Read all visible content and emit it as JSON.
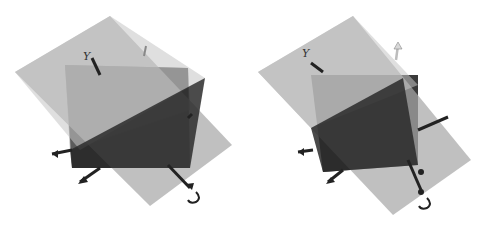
{
  "figure": {
    "colors": {
      "background": "#ffffff",
      "plane": "#9a9a9a",
      "plane_light": "#b8b8b8",
      "cube_dark": "#2e2e2e",
      "cube_mid": "#5a5a5a",
      "axis": "#222222",
      "up_arrow": "#e0e0e0"
    },
    "panels": [
      {
        "id": "left",
        "axis_labels": {
          "top": "Y",
          "bottom_right": "U"
        },
        "icons": [
          "axis-y-arrow",
          "axis-x-arrow",
          "axis-z-arrow",
          "rotation-arrow",
          "up-vector-arrow"
        ]
      },
      {
        "id": "right",
        "axis_labels": {
          "top": "Y",
          "bottom_right": "U"
        },
        "icons": [
          "axis-y-arrow",
          "axis-x-arrow",
          "axis-z-arrow",
          "rotation-arrow",
          "up-vector-arrow"
        ]
      }
    ]
  }
}
